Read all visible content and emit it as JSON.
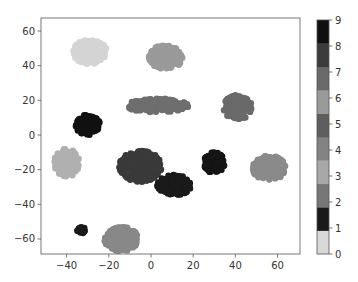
{
  "chart_data": {
    "type": "scatter",
    "title": "",
    "xlabel": "",
    "ylabel": "",
    "xlim": [
      -52,
      72
    ],
    "ylim": [
      -68,
      65
    ],
    "grid": false,
    "x_ticks": [
      -40,
      -20,
      0,
      20,
      40,
      60
    ],
    "y_ticks": [
      -60,
      -40,
      -20,
      0,
      20,
      40,
      60
    ],
    "colorbar": {
      "ticks": [
        0,
        1,
        2,
        3,
        4,
        5,
        6,
        7,
        8,
        9
      ],
      "colormap": "gray_r (discrete, 10 classes)",
      "colors": [
        "#d9d9d9",
        "#1a1a1a",
        "#777777",
        "#a8a8a8",
        "#838383",
        "#5e5e5e",
        "#9a9a9a",
        "#6a6a6a",
        "#3c3c3c",
        "#101010"
      ],
      "position": "right"
    },
    "clusters": [
      {
        "label": 0,
        "center": [
          -29,
          48
        ],
        "rx": 8,
        "ry": 7,
        "color": "#d4d4d4"
      },
      {
        "label": 6,
        "center": [
          7,
          45
        ],
        "rx": 8,
        "ry": 7,
        "color": "#9a9a9a"
      },
      {
        "label": 9,
        "center": [
          -30,
          6
        ],
        "rx": 6,
        "ry": 6,
        "color": "#111111"
      },
      {
        "label": 5,
        "center": [
          3,
          17
        ],
        "rx": 15,
        "ry": 4,
        "color": "#6e6e6e"
      },
      {
        "label": 7,
        "center": [
          41,
          16
        ],
        "rx": 7,
        "ry": 7,
        "color": "#6a6a6a"
      },
      {
        "label": 3,
        "center": [
          -40,
          -16
        ],
        "rx": 6,
        "ry": 8,
        "color": "#b0b0b0"
      },
      {
        "label": 8,
        "center": [
          -5,
          -18
        ],
        "rx": 10,
        "ry": 9,
        "color": "#3a3a3a"
      },
      {
        "label": 1,
        "center": [
          11,
          -29
        ],
        "rx": 8,
        "ry": 6,
        "color": "#1a1a1a"
      },
      {
        "label": 9,
        "center": [
          30,
          -16
        ],
        "rx": 5,
        "ry": 6,
        "color": "#151515"
      },
      {
        "label": 4,
        "center": [
          56,
          -19
        ],
        "rx": 8,
        "ry": 7,
        "color": "#8a8a8a"
      },
      {
        "label": 2,
        "center": [
          -14,
          -60
        ],
        "rx": 8,
        "ry": 7,
        "color": "#888888"
      },
      {
        "label": 1,
        "center": [
          -33,
          -55
        ],
        "rx": 2,
        "ry": 2,
        "color": "#1a1a1a"
      }
    ]
  }
}
